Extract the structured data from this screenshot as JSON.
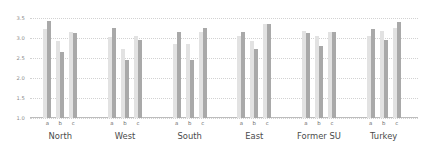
{
  "chart_data": {
    "type": "bar",
    "title": "",
    "xlabel": "",
    "ylabel": "",
    "ylim": [
      1.0,
      3.5
    ],
    "grid": true,
    "legend": "none",
    "yticks": [
      "1.0",
      "1.5",
      "2.0",
      "2.5",
      "3.0",
      "3.5"
    ],
    "ytick_values": [
      1.0,
      1.5,
      2.0,
      2.5,
      3.0,
      3.5
    ],
    "categories": [
      "North",
      "West",
      "South",
      "East",
      "Former SU",
      "Turkey"
    ],
    "subcategories": [
      "a",
      "b",
      "c"
    ],
    "series": [
      {
        "name": "light",
        "color": "#e2e2e2"
      },
      {
        "name": "dark",
        "color": "#a9a9a9"
      }
    ],
    "groups": [
      {
        "label": "North",
        "clusters": [
          {
            "label": "a",
            "values": [
              3.22,
              3.42
            ]
          },
          {
            "label": "b",
            "values": [
              2.93,
              2.66
            ]
          },
          {
            "label": "c",
            "values": [
              3.15,
              3.12
            ]
          }
        ]
      },
      {
        "label": "West",
        "clusters": [
          {
            "label": "a",
            "values": [
              3.03,
              3.24
            ]
          },
          {
            "label": "b",
            "values": [
              2.73,
              2.45
            ]
          },
          {
            "label": "c",
            "values": [
              3.05,
              2.95
            ]
          }
        ]
      },
      {
        "label": "South",
        "clusters": [
          {
            "label": "a",
            "values": [
              2.85,
              3.15
            ]
          },
          {
            "label": "b",
            "values": [
              2.84,
              2.46
            ]
          },
          {
            "label": "c",
            "values": [
              3.16,
              3.24
            ]
          }
        ]
      },
      {
        "label": "East",
        "clusters": [
          {
            "label": "a",
            "values": [
              3.06,
              3.14
            ]
          },
          {
            "label": "b",
            "values": [
              2.92,
              2.72
            ]
          },
          {
            "label": "c",
            "values": [
              3.36,
              3.36
            ]
          }
        ]
      },
      {
        "label": "Former SU",
        "clusters": [
          {
            "label": "a",
            "values": [
              3.17,
              3.13
            ]
          },
          {
            "label": "b",
            "values": [
              3.05,
              2.79
            ]
          },
          {
            "label": "c",
            "values": [
              3.15,
              3.15
            ]
          }
        ]
      },
      {
        "label": "Turkey",
        "clusters": [
          {
            "label": "a",
            "values": [
              3.06,
              3.22
            ]
          },
          {
            "label": "b",
            "values": [
              3.18,
              2.94
            ]
          },
          {
            "label": "c",
            "values": [
              3.25,
              3.4
            ]
          }
        ]
      }
    ]
  }
}
